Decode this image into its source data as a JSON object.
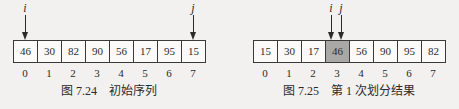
{
  "figures": [
    {
      "caption": "图 7.24    初始序列",
      "cells": [
        "46",
        "30",
        "82",
        "90",
        "56",
        "17",
        "95",
        "15"
      ],
      "indices": [
        "0",
        "1",
        "2",
        "3",
        "4",
        "5",
        "6",
        "7"
      ],
      "pointers": [
        {
          "label": "i",
          "cell_index": 0
        },
        {
          "label": "j",
          "cell_index": 7
        }
      ],
      "highlight_index": null
    },
    {
      "caption": "图 7.25    第 1 次划分结果",
      "cells": [
        "15",
        "30",
        "17",
        "46",
        "56",
        "90",
        "95",
        "82"
      ],
      "indices": [
        "0",
        "1",
        "2",
        "3",
        "4",
        "5",
        "6",
        "7"
      ],
      "pointers": [
        {
          "label": "i",
          "cell_index": 3
        },
        {
          "label": "j",
          "cell_index": 3
        }
      ],
      "highlight_index": 3
    }
  ],
  "colors": {
    "highlight_fill": "#a9a8a6",
    "cell_border": "#3a3a3a",
    "background": "#f3f1ef"
  }
}
